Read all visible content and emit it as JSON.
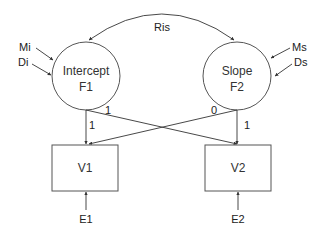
{
  "diagram": {
    "type": "path-diagram",
    "latent_factors": [
      {
        "id": "F1",
        "line1": "Intercept",
        "line2": "F1"
      },
      {
        "id": "F2",
        "line1": "Slope",
        "line2": "F2"
      }
    ],
    "observed": [
      {
        "id": "V1",
        "label": "V1"
      },
      {
        "id": "V2",
        "label": "V2"
      }
    ],
    "errors": [
      {
        "id": "E1",
        "label": "E1"
      },
      {
        "id": "E2",
        "label": "E2"
      }
    ],
    "factor_inputs": {
      "mi": "Mi",
      "di": "Di",
      "ms": "Ms",
      "ds": "Ds"
    },
    "covariance": {
      "label": "Ris"
    },
    "loadings": {
      "f1_v1": "1",
      "f1_v2": "1",
      "f2_v1": "0",
      "f2_v2": "1"
    }
  }
}
